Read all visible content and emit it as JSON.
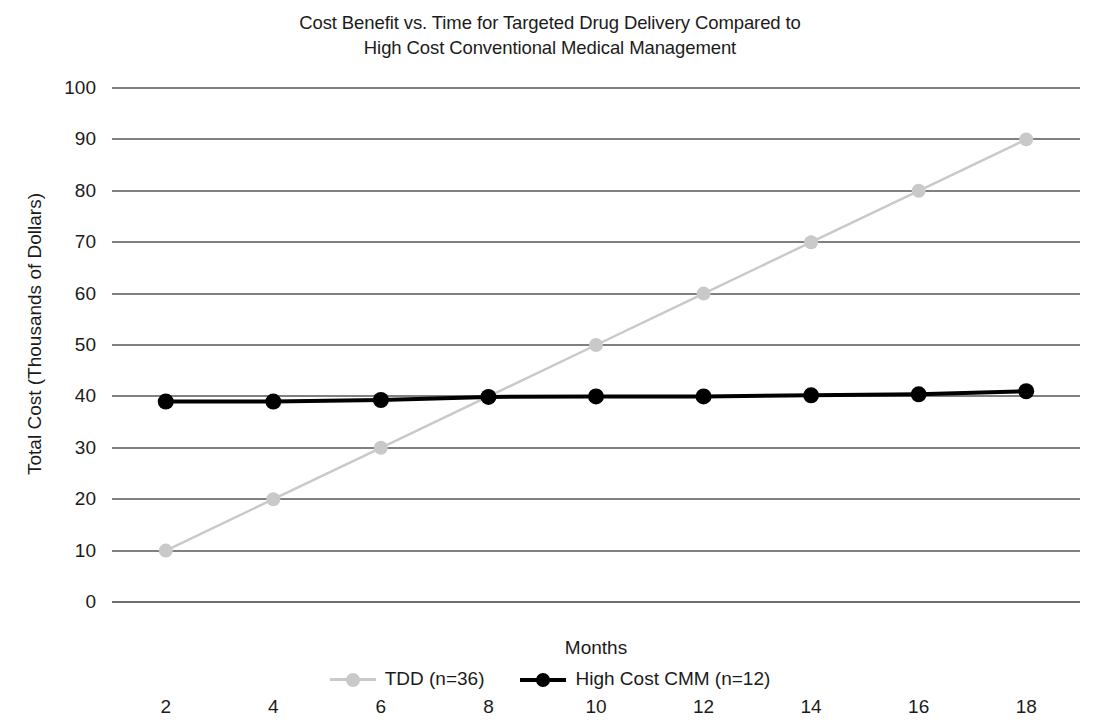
{
  "chart_data": {
    "type": "line",
    "title": "Cost Benefit vs. Time for Targeted Drug Delivery Compared to\nHigh Cost Conventional Medical Management",
    "xlabel": "Months",
    "ylabel": "Total Cost (Thousands of Dollars)",
    "x": [
      2,
      4,
      6,
      8,
      10,
      12,
      14,
      16,
      18
    ],
    "xtick_labels": [
      "2",
      "4",
      "6",
      "8",
      "10",
      "12",
      "14",
      "16",
      "18"
    ],
    "ytick_labels": [
      "0",
      "10",
      "20",
      "30",
      "40",
      "50",
      "60",
      "70",
      "80",
      "90",
      "100"
    ],
    "yticks": [
      0,
      10,
      20,
      30,
      40,
      50,
      60,
      70,
      80,
      90,
      100
    ],
    "xlim": [
      1,
      19
    ],
    "ylim": [
      0,
      100
    ],
    "grid": "horizontal",
    "legend_position": "bottom",
    "series": [
      {
        "name": "TDD (n=36)",
        "color": "#c9c9c9",
        "marker": "circle",
        "values": [
          10,
          20,
          30,
          40,
          50,
          60,
          70,
          80,
          90
        ]
      },
      {
        "name": "High Cost CMM (n=12)",
        "color": "#000000",
        "marker": "circle",
        "values": [
          39,
          39,
          39.3,
          39.9,
          40,
          40,
          40.2,
          40.4,
          41
        ]
      }
    ]
  },
  "legend": {
    "items": [
      {
        "label": "TDD (n=36)",
        "color": "#c9c9c9"
      },
      {
        "label": "High Cost CMM (n=12)",
        "color": "#000000"
      }
    ]
  }
}
